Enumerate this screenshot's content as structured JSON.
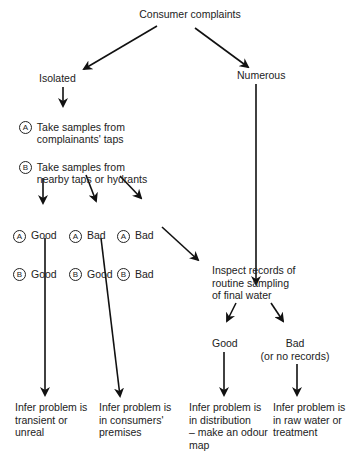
{
  "root": "Consumer complaints",
  "isolated": "Isolated",
  "numerous": "Numerous",
  "step_a": {
    "marker": "A",
    "text": "Take samples from\ncomplainants' taps"
  },
  "step_b": {
    "marker": "B",
    "text": "Take samples from\nnearby taps or hydrants"
  },
  "outcomes": [
    {
      "a": "Good",
      "b": "Good"
    },
    {
      "a": "Bad",
      "b": "Good"
    },
    {
      "a": "Bad",
      "b": "Bad"
    }
  ],
  "markers": {
    "a": "A",
    "b": "B"
  },
  "inspect": "Inspect records of\nroutine sampling\nof final water",
  "good": "Good",
  "bad": "Bad\n(or no records)",
  "conclusions": [
    "Infer problem is\ntransient or\nunreal",
    "Infer problem is\nin consumers'\npremises",
    "Infer problem is\nin distribution\n– make an odour\nmap",
    "Infer problem is\nin raw water or\ntreatment"
  ]
}
